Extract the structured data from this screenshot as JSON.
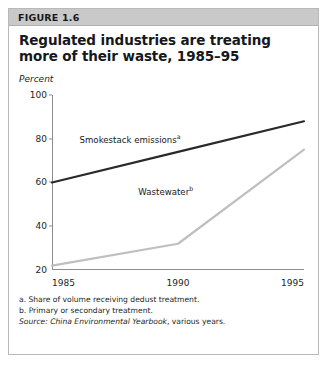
{
  "figure": {
    "number_label": "FIGURE 1.6",
    "title": "Regulated industries are treating more of their waste, 1985–95",
    "unit_label": "Percent"
  },
  "notes": {
    "a": "a. Share of volume receiving dedust treatment.",
    "b": "b. Primary or secondary treatment.",
    "source_prefix": "Source:",
    "source_title": "China Environmental Yearbook",
    "source_rest": ", various years."
  },
  "labels": {
    "smokestack": "Smokestack emissions",
    "smokestack_sup": "a",
    "wastewater": "Wastewater",
    "wastewater_sup": "b"
  },
  "colors": {
    "smokestack_line": "#2a2a2a",
    "wastewater_line": "#bfbfbf",
    "axis": "#8d8d8d",
    "header_bar": "#c9c9c9",
    "card_border": "#b9b9b9",
    "text": "#15181c"
  },
  "chart_data": {
    "type": "line",
    "title": "Regulated industries are treating more of their waste, 1985–95",
    "subtitle": "",
    "xlabel": "",
    "ylabel": "Percent",
    "x": [
      1985,
      1990,
      1995
    ],
    "xticklabels": [
      "1985",
      "1990",
      "1995"
    ],
    "yticks": [
      20,
      40,
      60,
      80,
      100
    ],
    "yticklabels": [
      "20",
      "40",
      "60",
      "80",
      "100"
    ],
    "xlim": [
      1985,
      1995
    ],
    "ylim": [
      20,
      100
    ],
    "grid": false,
    "legend": "inline-annotations",
    "series": [
      {
        "name": "Smokestack emissions",
        "footnote": "a",
        "color": "#2a2a2a",
        "values": [
          60,
          74,
          88
        ]
      },
      {
        "name": "Wastewater",
        "footnote": "b",
        "color": "#bfbfbf",
        "values": [
          22,
          32,
          75
        ]
      }
    ],
    "annotations": [
      {
        "text": "Smokestack emissions",
        "footnote": "a",
        "x": 1990.1,
        "y": 80
      },
      {
        "text": "Wastewater",
        "footnote": "b",
        "x": 1990.6,
        "y": 56
      }
    ]
  }
}
